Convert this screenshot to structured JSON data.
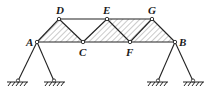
{
  "diagram": {
    "type": "truss-structure",
    "nodes": {
      "A": {
        "label": "A",
        "x": 37,
        "y": 42
      },
      "C": {
        "label": "C",
        "x": 83,
        "y": 42
      },
      "F": {
        "label": "F",
        "x": 130,
        "y": 42
      },
      "B": {
        "label": "B",
        "x": 175,
        "y": 42
      },
      "D": {
        "label": "D",
        "x": 59,
        "y": 19
      },
      "E": {
        "label": "E",
        "x": 107,
        "y": 19
      },
      "G": {
        "label": "G",
        "x": 152,
        "y": 19
      }
    },
    "labels": {
      "A": "A",
      "B": "B",
      "C": "C",
      "D": "D",
      "E": "E",
      "F": "F",
      "G": "G"
    },
    "members": [
      [
        "A",
        "D"
      ],
      [
        "D",
        "C"
      ],
      [
        "A",
        "C"
      ],
      [
        "D",
        "E"
      ],
      [
        "C",
        "E"
      ],
      [
        "E",
        "F"
      ],
      [
        "C",
        "F"
      ],
      [
        "F",
        "G"
      ],
      [
        "E",
        "G"
      ],
      [
        "G",
        "B"
      ],
      [
        "F",
        "B"
      ]
    ],
    "hatched_regions": [
      [
        "A",
        "D",
        "C"
      ],
      [
        "C",
        "E",
        "G",
        "B"
      ]
    ],
    "supports": [
      {
        "from": "A",
        "ground_x": 18,
        "ground_y": 81
      },
      {
        "from": "A",
        "ground_x": 54,
        "ground_y": 81
      },
      {
        "from": "B",
        "ground_x": 158,
        "ground_y": 81
      },
      {
        "from": "B",
        "ground_x": 193,
        "ground_y": 81
      }
    ],
    "colors": {
      "line": "#222222",
      "hatch": "#555555",
      "background": "#ffffff"
    }
  }
}
